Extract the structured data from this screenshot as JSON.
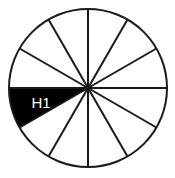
{
  "diagram": {
    "shape": "circle",
    "center": {
      "x": 88,
      "y": 88
    },
    "radius": 79,
    "sector_count": 12,
    "sector_angle_degrees": 30,
    "start_angle_degrees": 0,
    "colors": {
      "outline": "#1a1a1a",
      "spoke": "#1a1a1a",
      "background": "#ffffff",
      "filled_sector": "#000000",
      "label_text": "#ffffff"
    },
    "stroke_width": 2,
    "shaded_count": 1,
    "unshaded_count": 11,
    "fraction_shaded": "1/12",
    "sectors": [
      {
        "index": 0,
        "start_angle": 0,
        "end_angle": 30,
        "filled": false,
        "label": ""
      },
      {
        "index": 1,
        "start_angle": 30,
        "end_angle": 60,
        "filled": false,
        "label": ""
      },
      {
        "index": 2,
        "start_angle": 60,
        "end_angle": 90,
        "filled": false,
        "label": ""
      },
      {
        "index": 3,
        "start_angle": 90,
        "end_angle": 120,
        "filled": false,
        "label": ""
      },
      {
        "index": 4,
        "start_angle": 120,
        "end_angle": 150,
        "filled": false,
        "label": ""
      },
      {
        "index": 5,
        "start_angle": 150,
        "end_angle": 180,
        "filled": false,
        "label": ""
      },
      {
        "index": 6,
        "start_angle": 180,
        "end_angle": 210,
        "filled": true,
        "label": "H1"
      },
      {
        "index": 7,
        "start_angle": 210,
        "end_angle": 240,
        "filled": false,
        "label": ""
      },
      {
        "index": 8,
        "start_angle": 240,
        "end_angle": 270,
        "filled": false,
        "label": ""
      },
      {
        "index": 9,
        "start_angle": 270,
        "end_angle": 300,
        "filled": false,
        "label": ""
      },
      {
        "index": 10,
        "start_angle": 300,
        "end_angle": 330,
        "filled": false,
        "label": ""
      },
      {
        "index": 11,
        "start_angle": 330,
        "end_angle": 360,
        "filled": false,
        "label": ""
      }
    ],
    "labels": [
      {
        "text": "H1",
        "x": 41,
        "y": 104,
        "sector_index": 6,
        "color": "#ffffff",
        "font_size": 15
      }
    ]
  }
}
